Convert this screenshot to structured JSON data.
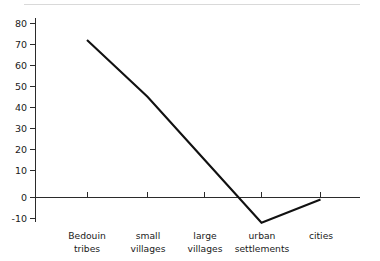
{
  "chart_data": {
    "type": "line",
    "title": "",
    "subtitle": "",
    "xlabel": "",
    "ylabel": "",
    "categories": [
      "Bedouin tribes",
      "small villages",
      "large villages",
      "urban settlements",
      "cities"
    ],
    "category_lines": [
      [
        "Bedouin",
        "tribes"
      ],
      [
        "small",
        "villages"
      ],
      [
        "large",
        "villages"
      ],
      [
        "urban",
        "settlements"
      ],
      [
        "cities"
      ]
    ],
    "series": [
      {
        "name": "",
        "values": [
          75,
          48,
          18,
          -12,
          -1
        ]
      }
    ],
    "ylim": [
      -10,
      80
    ],
    "yticks": [
      80,
      70,
      60,
      50,
      40,
      30,
      20,
      10,
      0,
      -10
    ],
    "ytick_labels": [
      "80",
      "70",
      "60",
      "50",
      "40",
      "30",
      "20",
      "10",
      "0",
      "-10"
    ],
    "grid": false,
    "legend": "none",
    "zero_line": true,
    "line_color": "#111111",
    "axis_color": "#2b2b2b",
    "background_color": "#ffffff",
    "note": "Single polyline descending steeply from Bedouin tribes through small villages and large villages, reaching a minimum below zero at urban settlements, then rising back toward zero at cities."
  }
}
